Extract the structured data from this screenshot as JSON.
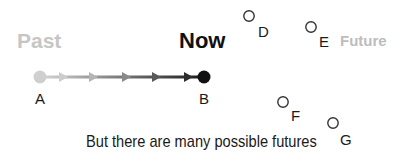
{
  "timeline": {
    "past_label": "Past",
    "now_label": "Now",
    "future_label": "Future",
    "colors": {
      "past": "#c6c6c6",
      "now": "#111111",
      "future": "#bdbdbd"
    }
  },
  "path": {
    "start_point": {
      "label": "A",
      "color": "#cfcfcf"
    },
    "end_point": {
      "label": "B",
      "color": "#111111"
    },
    "arrowheads": 5
  },
  "possible_futures": [
    {
      "label": "D"
    },
    {
      "label": "E"
    },
    {
      "label": "F"
    },
    {
      "label": "G"
    }
  ],
  "caption": "But there are many possible futures"
}
